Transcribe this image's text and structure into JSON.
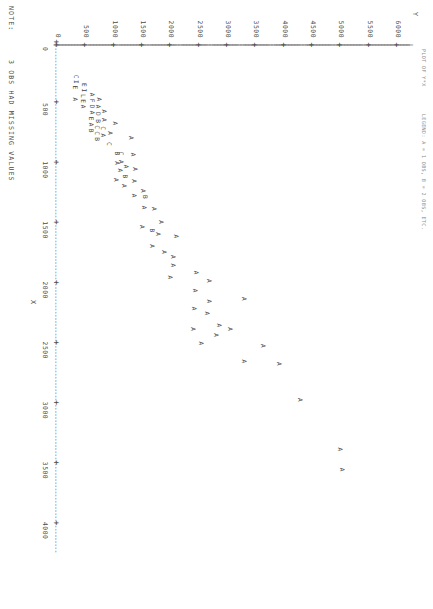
{
  "header": {
    "line1": "PLOT OF Y*X        LEGEND: A = 1 OBS, B = 2 OBS, ETC."
  },
  "footer": {
    "note_label": "NOTE:",
    "note_text": "3 OBS HAD MISSING VALUES"
  },
  "chart_data": {
    "type": "scatter",
    "title": "PLOT OF Y*X",
    "legend_text": "LEGEND: A = 1 OBS, B = 2 OBS, ETC.",
    "xlabel": "X",
    "ylabel": "Y",
    "xlim": [
      0,
      4250
    ],
    "ylim": [
      0,
      6250
    ],
    "xticks": [
      0,
      500,
      1000,
      1500,
      2000,
      2500,
      3000,
      3500,
      4000
    ],
    "yticks": [
      0,
      500,
      1000,
      1500,
      2000,
      2500,
      3000,
      3500,
      4000,
      4500,
      5000,
      5500,
      6000
    ],
    "xtick_labels": [
      "0",
      "500",
      "1000",
      "1500",
      "2000",
      "2500",
      "3000",
      "3500",
      "4000"
    ],
    "ytick_labels": [
      "0",
      "500",
      "1000",
      "1500",
      "2000",
      "2500",
      "3000",
      "3500",
      "4000",
      "4500",
      "5000",
      "5500",
      "6000"
    ],
    "grid": false,
    "legend_position": "top-right",
    "marker_scheme": {
      "A": 1,
      "B": 2,
      "C": 3,
      "D": 4,
      "E": 5,
      "F": 6,
      "I": 9,
      "L": 12
    },
    "points": [
      {
        "label": "A",
        "x": 3500,
        "y": 5000
      },
      {
        "label": "A",
        "x": 3330,
        "y": 4960
      },
      {
        "label": "A",
        "x": 2920,
        "y": 4250
      },
      {
        "label": "A",
        "x": 2620,
        "y": 3880
      },
      {
        "label": "A",
        "x": 2470,
        "y": 3600
      },
      {
        "label": "A",
        "x": 2600,
        "y": 3270
      },
      {
        "label": "A",
        "x": 2080,
        "y": 3260
      },
      {
        "label": "A",
        "x": 2330,
        "y": 3020
      },
      {
        "label": "A",
        "x": 2300,
        "y": 2830
      },
      {
        "label": "A",
        "x": 2380,
        "y": 2770
      },
      {
        "label": "A",
        "x": 1930,
        "y": 2640
      },
      {
        "label": "A",
        "x": 2100,
        "y": 2640
      },
      {
        "label": "A",
        "x": 2200,
        "y": 2610
      },
      {
        "label": "A",
        "x": 2450,
        "y": 2510
      },
      {
        "label": "A",
        "x": 1860,
        "y": 2420
      },
      {
        "label": "A",
        "x": 2010,
        "y": 2400
      },
      {
        "label": "A",
        "x": 2160,
        "y": 2390
      },
      {
        "label": "A",
        "x": 2330,
        "y": 2370
      },
      {
        "label": "A",
        "x": 1560,
        "y": 2060
      },
      {
        "label": "A",
        "x": 1730,
        "y": 2020
      },
      {
        "label": "A",
        "x": 1800,
        "y": 2010
      },
      {
        "label": "A",
        "x": 1900,
        "y": 1960
      },
      {
        "label": "A",
        "x": 1690,
        "y": 1860
      },
      {
        "label": "A",
        "x": 1440,
        "y": 1800
      },
      {
        "label": "A",
        "x": 1540,
        "y": 1740
      },
      {
        "label": "A",
        "x": 1330,
        "y": 1680
      },
      {
        "label": "B",
        "x": 1510,
        "y": 1640
      },
      {
        "label": "A",
        "x": 1640,
        "y": 1640
      },
      {
        "label": "B",
        "x": 1230,
        "y": 1510
      },
      {
        "label": "A",
        "x": 1320,
        "y": 1500
      },
      {
        "label": "A",
        "x": 1180,
        "y": 1480
      },
      {
        "label": "A",
        "x": 1480,
        "y": 1460
      },
      {
        "label": "A",
        "x": 1000,
        "y": 1340
      },
      {
        "label": "A",
        "x": 1100,
        "y": 1330
      },
      {
        "label": "A",
        "x": 1220,
        "y": 1320
      },
      {
        "label": "A",
        "x": 880,
        "y": 1300
      },
      {
        "label": "A",
        "x": 740,
        "y": 1270
      },
      {
        "label": "A",
        "x": 980,
        "y": 1180
      },
      {
        "label": "B",
        "x": 1060,
        "y": 1160
      },
      {
        "label": "A",
        "x": 1140,
        "y": 1150
      },
      {
        "label": "C",
        "x": 870,
        "y": 1100
      },
      {
        "label": "A",
        "x": 940,
        "y": 1090
      },
      {
        "label": "A",
        "x": 1010,
        "y": 1080
      },
      {
        "label": "B",
        "x": 870,
        "y": 1030
      },
      {
        "label": "A",
        "x": 950,
        "y": 1020
      },
      {
        "label": "A",
        "x": 1090,
        "y": 1010
      },
      {
        "label": "A",
        "x": 620,
        "y": 980
      },
      {
        "label": "A",
        "x": 700,
        "y": 900
      },
      {
        "label": "C",
        "x": 790,
        "y": 890
      },
      {
        "label": "A",
        "x": 520,
        "y": 800
      },
      {
        "label": "A",
        "x": 590,
        "y": 790
      },
      {
        "label": "C",
        "x": 660,
        "y": 780
      },
      {
        "label": "A",
        "x": 720,
        "y": 775
      },
      {
        "label": "A",
        "x": 420,
        "y": 700
      },
      {
        "label": "A",
        "x": 480,
        "y": 690
      },
      {
        "label": "D",
        "x": 540,
        "y": 685
      },
      {
        "label": "B",
        "x": 600,
        "y": 680
      },
      {
        "label": "C",
        "x": 650,
        "y": 675
      },
      {
        "label": "C",
        "x": 700,
        "y": 670
      },
      {
        "label": "B",
        "x": 750,
        "y": 665
      },
      {
        "label": "A",
        "x": 380,
        "y": 590
      },
      {
        "label": "F",
        "x": 430,
        "y": 585
      },
      {
        "label": "D",
        "x": 480,
        "y": 580
      },
      {
        "label": "A",
        "x": 530,
        "y": 575
      },
      {
        "label": "E",
        "x": 580,
        "y": 570
      },
      {
        "label": "A",
        "x": 630,
        "y": 565
      },
      {
        "label": "B",
        "x": 680,
        "y": 560
      },
      {
        "label": "E",
        "x": 300,
        "y": 440
      },
      {
        "label": "I",
        "x": 345,
        "y": 435
      },
      {
        "label": "L",
        "x": 390,
        "y": 430
      },
      {
        "label": "E",
        "x": 435,
        "y": 425
      },
      {
        "label": "A",
        "x": 480,
        "y": 420
      },
      {
        "label": "C",
        "x": 230,
        "y": 300
      },
      {
        "label": "I",
        "x": 275,
        "y": 295
      },
      {
        "label": "E",
        "x": 320,
        "y": 290
      },
      {
        "label": "A",
        "x": 420,
        "y": 285
      }
    ]
  }
}
